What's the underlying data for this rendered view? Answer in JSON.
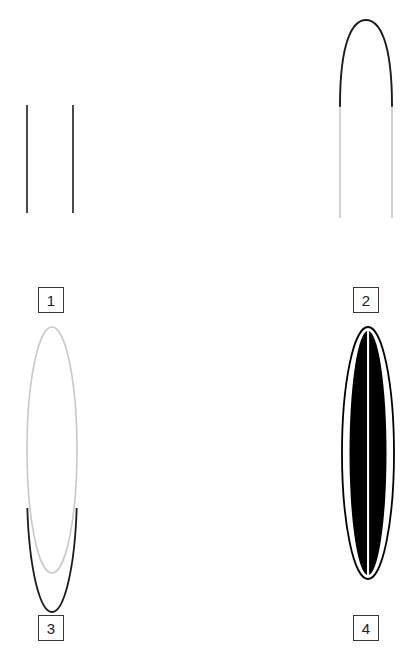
{
  "figure": {
    "background_color": "#ffffff",
    "width": 419,
    "height": 651,
    "layout": "2x2 grid of unlabeled geometric line panels with numbered caption boxes"
  },
  "colors": {
    "background": "#ffffff",
    "dark_stroke": "#1c1c1c",
    "light_stroke": "#c9c9c9",
    "fill_black": "#000000",
    "label_border": "#3a3a3a",
    "label_text": "#222222"
  },
  "panels": [
    {
      "id": "panel-1",
      "label": "1",
      "shape": "two-vertical-lines",
      "description": "Two short dark vertical line segments side by side",
      "elements": [
        {
          "name": "left-line",
          "x": 27,
          "y1": 105,
          "y2": 213,
          "color": "#1c1c1c",
          "width": 1.6
        },
        {
          "name": "right-line",
          "x": 73,
          "y1": 105,
          "y2": 213,
          "color": "#1c1c1c",
          "width": 1.6
        }
      ]
    },
    {
      "id": "panel-2",
      "label": "2",
      "shape": "arch",
      "description": "Arch with dark rounded apex and light gray vertical legs",
      "elements": [
        {
          "name": "arch-apex",
          "apex_x": 366,
          "apex_y": 30,
          "color": "#1c1c1c",
          "width": 1.8
        },
        {
          "name": "left-leg",
          "x": 340,
          "y1": 105,
          "y2": 218,
          "color": "#c9c9c9",
          "width": 1.6
        },
        {
          "name": "right-leg",
          "x": 392,
          "y1": 105,
          "y2": 218,
          "color": "#c9c9c9",
          "width": 1.6
        }
      ]
    },
    {
      "id": "panel-3",
      "label": "3",
      "shape": "ellipse-outline",
      "description": "Tall narrow ellipse outline, light gray with dark lower arc",
      "elements": [
        {
          "name": "ellipse-outline",
          "cx": 52,
          "cy": 450,
          "rx": 25,
          "ry": 123,
          "light_color": "#c9c9c9",
          "dark_color": "#1c1c1c",
          "dark_arc_start_y": 508
        }
      ]
    },
    {
      "id": "panel-4",
      "label": "4",
      "shape": "filled-ellipse-striped",
      "description": "Filled black ellipse with thin white center stripe and white gaps inside outline",
      "elements": [
        {
          "name": "outer-ellipse-outline",
          "cx": 368,
          "cy": 453,
          "rx": 26,
          "ry": 126,
          "color": "#000000"
        },
        {
          "name": "black-core",
          "cx": 368,
          "cy": 453,
          "rx": 19,
          "ry": 122,
          "color": "#000000"
        },
        {
          "name": "center-white-stripe",
          "x": 368,
          "width": 2,
          "color": "#ffffff"
        }
      ]
    }
  ],
  "labels": [
    {
      "id": "label-1",
      "text": "1",
      "panel": "panel-1"
    },
    {
      "id": "label-2",
      "text": "2",
      "panel": "panel-2"
    },
    {
      "id": "label-3",
      "text": "3",
      "panel": "panel-3"
    },
    {
      "id": "label-4",
      "text": "4",
      "panel": "panel-4"
    }
  ]
}
